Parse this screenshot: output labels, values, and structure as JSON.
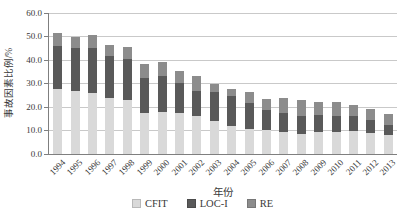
{
  "chart_data": {
    "type": "bar",
    "stacked": true,
    "title": "",
    "xlabel": "年份",
    "ylabel": "事故因素比例/%",
    "ylim": [
      0,
      60
    ],
    "ytick_step": 10,
    "yticks": [
      "0.0",
      "10.0",
      "20.0",
      "30.0",
      "40.0",
      "50.0",
      "60.0"
    ],
    "grid": true,
    "legend_position": "bottom",
    "categories": [
      "1994",
      "1995",
      "1996",
      "1997",
      "1998",
      "1999",
      "2000",
      "2001",
      "2002",
      "2003",
      "2004",
      "2005",
      "2006",
      "2007",
      "2008",
      "2009",
      "2010",
      "2011",
      "2012",
      "2013"
    ],
    "series": [
      {
        "name": "CFIT",
        "color": "#d9d9d9",
        "values": [
          27.5,
          27.0,
          26.0,
          24.0,
          23.0,
          17.5,
          18.0,
          17.3,
          16.0,
          14.2,
          12.0,
          10.5,
          10.2,
          9.2,
          8.5,
          9.5,
          9.5,
          9.8,
          9.0,
          8.0
        ]
      },
      {
        "name": "LOC-I",
        "color": "#595959",
        "values": [
          18.5,
          18.0,
          19.0,
          17.5,
          17.5,
          15.0,
          15.0,
          13.0,
          11.0,
          12.3,
          12.7,
          11.0,
          8.5,
          8.2,
          7.5,
          7.0,
          6.5,
          6.2,
          5.3,
          4.5
        ]
      },
      {
        "name": "RE",
        "color": "#8c8c8c",
        "values": [
          5.5,
          5.0,
          5.5,
          5.0,
          5.0,
          6.0,
          6.0,
          5.2,
          6.0,
          3.5,
          2.8,
          4.8,
          4.7,
          6.6,
          6.8,
          5.8,
          6.0,
          5.0,
          4.7,
          4.7
        ]
      }
    ],
    "colors": {
      "axis_line": "#7f7f7f",
      "gridline": "#c9c9c9",
      "text": "#3a3a3a"
    }
  }
}
